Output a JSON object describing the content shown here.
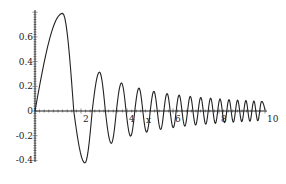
{
  "chart_data": {
    "type": "line",
    "title": "",
    "xlabel": "x",
    "ylabel": "",
    "xlim": [
      0,
      10
    ],
    "ylim": [
      -0.4,
      0.8
    ],
    "grid": false,
    "legend": "none",
    "x_ticks": [
      {
        "value": 2,
        "label": "2"
      },
      {
        "value": 4,
        "label": "4"
      },
      {
        "value": 6,
        "label": "6"
      },
      {
        "value": 8,
        "label": "8"
      },
      {
        "value": 10,
        "label": "10"
      }
    ],
    "y_ticks": [
      {
        "value": 0.6,
        "label": "0.6"
      },
      {
        "value": 0.4,
        "label": "0.4"
      },
      {
        "value": 0.2,
        "label": "0.2"
      },
      {
        "value": 0,
        "label": "0"
      },
      {
        "value": -0.2,
        "label": "-0.2"
      },
      {
        "value": -0.4,
        "label": "-0.4"
      }
    ],
    "x_minor_step": 0.2,
    "y_minor_step": 0.02,
    "series": [
      {
        "name": "f(x)",
        "color": "#222222",
        "description": "decaying chirp oscillation, approx sin(x^2)/x^1.12",
        "start": [
          0,
          0
        ],
        "extrema": [
          [
            1.2,
            0.79
          ],
          [
            2.171,
            -0.42
          ],
          [
            2.803,
            0.315
          ],
          [
            3.316,
            -0.261
          ],
          [
            3.76,
            0.227
          ],
          [
            4.157,
            -0.203
          ],
          [
            4.52,
            0.185
          ],
          [
            4.854,
            -0.171
          ],
          [
            5.168,
            0.159
          ],
          [
            5.463,
            -0.149
          ],
          [
            5.743,
            0.141
          ],
          [
            6.01,
            -0.134
          ],
          [
            6.267,
            0.128
          ],
          [
            6.514,
            -0.122
          ],
          [
            6.752,
            0.118
          ],
          [
            6.983,
            -0.113
          ],
          [
            7.207,
            0.109
          ],
          [
            7.424,
            -0.106
          ],
          [
            7.636,
            0.103
          ],
          [
            7.842,
            -0.1
          ],
          [
            8.044,
            0.097
          ],
          [
            8.241,
            -0.094
          ],
          [
            8.434,
            0.092
          ],
          [
            8.623,
            -0.09
          ],
          [
            8.808,
            0.087
          ],
          [
            8.99,
            -0.085
          ],
          [
            9.169,
            0.084
          ],
          [
            9.344,
            -0.082
          ],
          [
            9.516,
            0.08
          ],
          [
            9.686,
            -0.078
          ],
          [
            9.853,
            0.077
          ]
        ],
        "end": [
          10,
          0.01
        ]
      }
    ]
  }
}
